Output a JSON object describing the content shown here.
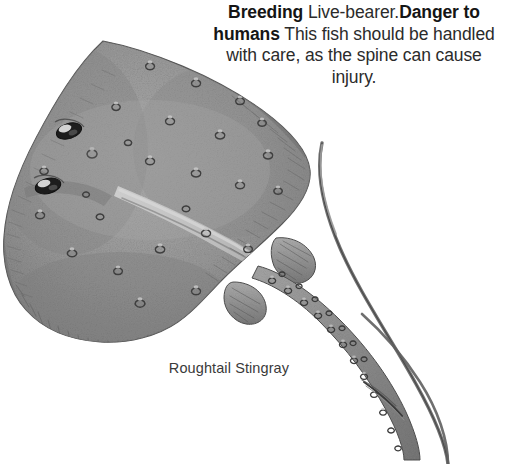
{
  "page": {
    "background_color": "#ffffff",
    "width": 526,
    "height": 464
  },
  "info": {
    "breeding_term": "Breeding",
    "breeding_text": " Live-bearer.",
    "danger_term": "Danger to humans",
    "danger_text": " This fish should be handled with care, as the spine can cause injury.",
    "text_color": "#2b2b2b",
    "term_color": "#151515"
  },
  "caption": {
    "label": "Roughtail Stingray",
    "color": "#3a3a3a"
  },
  "illustration": {
    "name": "roughtail-stingray-illustration",
    "subject": "Roughtail Stingray",
    "style": "grayscale engraving",
    "body_color": "#9b9b9b",
    "shadow_color": "#6f6f6f",
    "outline_color": "#4a4a4a",
    "highlight_color": "#cfcfcf",
    "eye_color": "#1d1d1d",
    "parts": [
      "pectoral-disc",
      "left-eye",
      "right-eye",
      "spiracle",
      "pelvic-fin-left",
      "pelvic-fin-right",
      "tail",
      "tail-tubercles",
      "venomous-spine"
    ]
  }
}
